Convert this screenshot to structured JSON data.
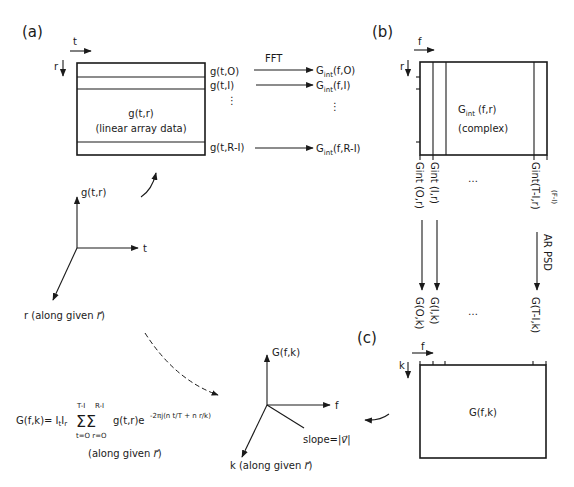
{
  "panels": {
    "a": {
      "label": "(a)",
      "axis_t": "t",
      "axis_r": "r",
      "box_title": "g(t,r)",
      "box_subtitle": "(linear array data)",
      "rows": [
        "g(t,O)",
        "g(t,I)",
        "g(t,R-I)"
      ],
      "transform": "FFT",
      "outputs": [
        "G",
        "int",
        "(f,O)",
        "(f,I)",
        "(f,R-I)"
      ],
      "plot_axis_y": "g(t,r)",
      "plot_axis_x": "t",
      "plot_axis_z": "r (along given ⃗r)"
    },
    "b": {
      "label": "(b)",
      "axis_f": "f",
      "axis_r": "r",
      "box_title_main": "G",
      "box_title_sub": "int",
      "box_title_args": "(f,r)",
      "box_subtitle": "(complex)",
      "columns": [
        "Gint (O,r)",
        "Gint (I,r)",
        "Gint(T-I,r)"
      ],
      "column_annotation": "(F-I)",
      "ellipsis": "…",
      "transform": "AR PSD",
      "results": [
        "G(O,k)",
        "G(I,k)",
        "G(T-I,k)"
      ]
    },
    "c": {
      "label": "(c)",
      "axis_f": "f",
      "axis_k": "k",
      "box_title": "G(f,k)",
      "plot_axis_y": "G(f,k)",
      "plot_axis_x": "f",
      "plot_axis_z": "k (along given r)",
      "slope": "slope=|v|"
    }
  },
  "equation": {
    "lhs": "G(f,k)= I",
    "sub_t": "t",
    "mid": "I",
    "sub_r": "r",
    "sum_upper_1": "T-I",
    "sum_upper_2": "R-I",
    "sum_lower": "t=O r=O",
    "body": "g(t,r)e",
    "exponent": "-2πj(n t/T + n r/k)",
    "note": "(along given r)"
  }
}
